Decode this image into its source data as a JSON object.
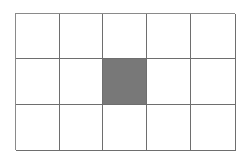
{
  "grid": {
    "rows": 3,
    "cols": 5,
    "line_color": "#6e6e6e",
    "cell_color": "#ffffff",
    "shaded_color": "#787878",
    "shaded_cells": [
      {
        "row": 1,
        "col": 2
      }
    ]
  }
}
